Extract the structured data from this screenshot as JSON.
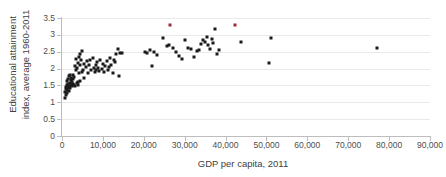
{
  "chart_data": {
    "type": "scatter",
    "title": "",
    "xlabel": "GDP per capita, 2011",
    "ylabel": "Educational attainment index, average 1960-2011",
    "ylabel_line1": "Educational attainment",
    "ylabel_line2": "index, average 1960-2011",
    "xlim": [
      0,
      90000
    ],
    "ylim": [
      0,
      3.5
    ],
    "xticks": [
      0,
      10000,
      20000,
      30000,
      40000,
      50000,
      60000,
      70000,
      80000,
      90000
    ],
    "xticklabels": [
      "0",
      "10,000",
      "20,000",
      "30,000",
      "40,000",
      "50,000",
      "60,000",
      "70,000",
      "80,000",
      "90,000"
    ],
    "yticks": [
      0,
      0.5,
      1,
      1.5,
      2,
      2.5,
      3,
      3.5
    ],
    "yticklabels": [
      "0",
      "0.5",
      "1",
      "1.5",
      "2",
      "2.5",
      "3",
      "3.5"
    ],
    "grid": "horizontal",
    "legend": "none",
    "marker": "square",
    "marker_color": "#1a1a1a",
    "highlight_color": "#9e2b37",
    "series": [
      {
        "name": "Countries",
        "color": "#1a1a1a",
        "points": [
          [
            700,
            1.12
          ],
          [
            800,
            1.3
          ],
          [
            900,
            1.22
          ],
          [
            1000,
            1.38
          ],
          [
            1100,
            1.45
          ],
          [
            1150,
            1.28
          ],
          [
            1200,
            1.52
          ],
          [
            1250,
            1.35
          ],
          [
            1300,
            1.62
          ],
          [
            1400,
            1.41
          ],
          [
            1500,
            1.55
          ],
          [
            1550,
            1.7
          ],
          [
            1600,
            1.33
          ],
          [
            1700,
            1.48
          ],
          [
            1800,
            1.78
          ],
          [
            1850,
            1.58
          ],
          [
            1900,
            1.8
          ],
          [
            2000,
            1.43
          ],
          [
            2100,
            1.65
          ],
          [
            2200,
            1.5
          ],
          [
            2300,
            1.72
          ],
          [
            2400,
            1.6
          ],
          [
            2500,
            1.47
          ],
          [
            2600,
            1.82
          ],
          [
            2700,
            1.55
          ],
          [
            2800,
            1.68
          ],
          [
            2900,
            1.51
          ],
          [
            3000,
            1.75
          ],
          [
            3100,
            2.07
          ],
          [
            3200,
            1.49
          ],
          [
            3400,
            1.95
          ],
          [
            3500,
            2.28
          ],
          [
            3600,
            1.58
          ],
          [
            3700,
            2.02
          ],
          [
            3800,
            1.52
          ],
          [
            3900,
            2.18
          ],
          [
            4000,
            1.6
          ],
          [
            4100,
            2.34
          ],
          [
            4200,
            1.88
          ],
          [
            4300,
            2.12
          ],
          [
            4400,
            2.42
          ],
          [
            4500,
            1.64
          ],
          [
            4700,
            2.25
          ],
          [
            4800,
            1.9
          ],
          [
            5000,
            2.52
          ],
          [
            5100,
            1.97
          ],
          [
            5300,
            2.15
          ],
          [
            5500,
            1.73
          ],
          [
            5800,
            2.05
          ],
          [
            6000,
            2.21
          ],
          [
            6300,
            1.86
          ],
          [
            6600,
            2.1
          ],
          [
            6900,
            2.26
          ],
          [
            7200,
            1.95
          ],
          [
            7500,
            2.31
          ],
          [
            7800,
            2.01
          ],
          [
            8000,
            1.89
          ],
          [
            8200,
            2.12
          ],
          [
            8400,
            1.96
          ],
          [
            8600,
            2.19
          ],
          [
            8800,
            2.02
          ],
          [
            9100,
            1.93
          ],
          [
            9400,
            2.24
          ],
          [
            9700,
            1.98
          ],
          [
            10000,
            2.14
          ],
          [
            10300,
            1.9
          ],
          [
            10600,
            2.08
          ],
          [
            10900,
            2.22
          ],
          [
            11200,
            1.96
          ],
          [
            11500,
            2.05
          ],
          [
            11800,
            2.31
          ],
          [
            12100,
            2.11
          ],
          [
            12400,
            1.88
          ],
          [
            12700,
            2.25
          ],
          [
            13000,
            2.19
          ],
          [
            13300,
            2.43
          ],
          [
            13600,
            2.57
          ],
          [
            13900,
            1.78
          ],
          [
            14300,
            2.46
          ],
          [
            14700,
            2.46
          ],
          [
            20200,
            2.5
          ],
          [
            20800,
            2.47
          ],
          [
            21400,
            2.55
          ],
          [
            22000,
            2.07
          ],
          [
            22600,
            2.48
          ],
          [
            23200,
            2.41
          ],
          [
            24800,
            2.91
          ],
          [
            25600,
            2.66
          ],
          [
            26200,
            2.71
          ],
          [
            27200,
            2.6
          ],
          [
            28000,
            2.5
          ],
          [
            28700,
            2.36
          ],
          [
            29400,
            2.29
          ],
          [
            30100,
            2.84
          ],
          [
            30800,
            2.62
          ],
          [
            31500,
            2.57
          ],
          [
            32200,
            2.35
          ],
          [
            32900,
            2.52
          ],
          [
            33500,
            2.55
          ],
          [
            34100,
            2.72
          ],
          [
            34600,
            2.85
          ],
          [
            35000,
            2.78
          ],
          [
            35400,
            2.93
          ],
          [
            35800,
            2.69
          ],
          [
            36200,
            2.58
          ],
          [
            36600,
            2.89
          ],
          [
            37000,
            2.75
          ],
          [
            37400,
            3.16
          ],
          [
            37800,
            2.43
          ],
          [
            38400,
            2.55
          ],
          [
            43800,
            2.79
          ],
          [
            50600,
            2.17
          ],
          [
            51200,
            2.91
          ],
          [
            77000,
            2.61
          ]
        ]
      },
      {
        "name": "Highlighted",
        "color": "#9e2b37",
        "points": [
          [
            26500,
            3.28
          ],
          [
            42300,
            3.3
          ]
        ]
      }
    ]
  }
}
